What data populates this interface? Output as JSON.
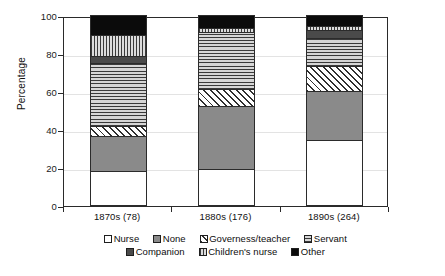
{
  "chart_data": {
    "type": "bar",
    "subtype": "stacked-percentage-column",
    "title": "",
    "xlabel": "",
    "ylabel": "Percentage",
    "ylim": [
      0,
      100
    ],
    "yticks": [
      0,
      20,
      40,
      60,
      80,
      100
    ],
    "grid": true,
    "legend_position": "bottom",
    "categories": [
      "1870s (78)",
      "1880s (176)",
      "1890s (264)"
    ],
    "category_counts": [
      78,
      176,
      264
    ],
    "series": [
      {
        "name": "Nurse",
        "values": [
          18,
          19,
          34
        ],
        "color": "#ffffff",
        "pattern": "solid-white"
      },
      {
        "name": "None",
        "values": [
          18.5,
          33,
          26
        ],
        "color": "#8a8a8a",
        "pattern": "solid-gray"
      },
      {
        "name": "Governess/teacher",
        "values": [
          5,
          9,
          13
        ],
        "color": "#ffffff",
        "pattern": "diagonal-hatch"
      },
      {
        "name": "Servant",
        "values": [
          33,
          30,
          15
        ],
        "color": "#e9e9e9",
        "pattern": "horizontal-lines"
      },
      {
        "name": "Companion",
        "values": [
          4,
          0,
          4
        ],
        "color": "#4a4a4a",
        "pattern": "solid-dark-gray"
      },
      {
        "name": "Children's nurse",
        "values": [
          11,
          2,
          2
        ],
        "color": "#e4e4e4",
        "pattern": "vertical-lines"
      },
      {
        "name": "Other",
        "values": [
          10.5,
          7,
          6
        ],
        "color": "#0b0b0b",
        "pattern": "solid-black"
      }
    ]
  },
  "axis": {
    "y_title": "Percentage",
    "y_tick_labels": [
      "0",
      "20",
      "40",
      "60",
      "80",
      "100"
    ],
    "x_tick_labels": [
      "1870s (78)",
      "1880s (176)",
      "1890s (264)"
    ]
  },
  "legend": {
    "rows": [
      [
        {
          "label": "Nurse",
          "swatch": "swatch-nurse"
        },
        {
          "label": "None",
          "swatch": "swatch-none"
        },
        {
          "label": "Governess/teacher",
          "swatch": "swatch-governess"
        },
        {
          "label": "Servant",
          "swatch": "swatch-servant"
        }
      ],
      [
        {
          "label": "Companion",
          "swatch": "swatch-companion"
        },
        {
          "label": "Children's nurse",
          "swatch": "swatch-childrens-nurse"
        },
        {
          "label": "Other",
          "swatch": "swatch-other"
        }
      ]
    ]
  },
  "colors": {
    "axis": "#2a2a2a",
    "grid": "#e3e3e3",
    "text": "#111111",
    "none_fill": "#8a8a8a",
    "companion_fill": "#4a4a4a",
    "other_fill": "#0b0b0b"
  }
}
